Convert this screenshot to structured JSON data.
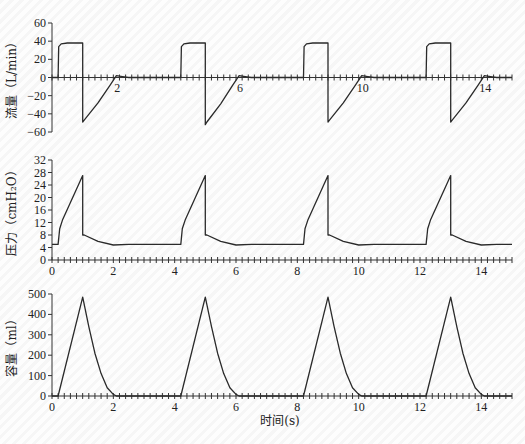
{
  "chart_data": [
    {
      "type": "line",
      "title": "",
      "ylabel": "流量（L/min）",
      "xlabel": "",
      "xlim": [
        0,
        15
      ],
      "ylim": [
        -60,
        60
      ],
      "yticks": [
        60,
        40,
        20,
        0,
        -20,
        -40,
        -60
      ],
      "xticks_labeled": [
        2,
        6,
        10,
        14
      ],
      "x_axis_at_y": 0,
      "grid": false,
      "series": [
        {
          "name": "flow",
          "x": [
            0,
            0.2,
            0.22,
            0.3,
            0.5,
            1.0,
            1.0,
            1.05,
            1.5,
            1.9,
            2.1,
            2.3,
            2.5,
            4.2,
            4.22,
            4.3,
            4.5,
            5.0,
            5.0,
            5.05,
            5.5,
            5.9,
            6.1,
            6.3,
            6.5,
            8.2,
            8.22,
            8.3,
            8.5,
            9.0,
            9.0,
            9.05,
            9.5,
            9.9,
            10.1,
            10.3,
            10.5,
            12.2,
            12.22,
            12.3,
            12.5,
            13.0,
            13.0,
            13.05,
            13.5,
            13.9,
            14.1,
            14.3,
            14.5,
            15.0
          ],
          "values": [
            0,
            0,
            34,
            37,
            38,
            38,
            -49,
            -47,
            -28,
            -8,
            2,
            1,
            0,
            0,
            34,
            37,
            38,
            38,
            -52,
            -49,
            -29,
            -8,
            2,
            1,
            0,
            0,
            34,
            37,
            38,
            38,
            -49,
            -47,
            -28,
            -8,
            2,
            1,
            0,
            0,
            34,
            37,
            38,
            38,
            -49,
            -47,
            -28,
            -8,
            2,
            1,
            0,
            0
          ]
        }
      ]
    },
    {
      "type": "line",
      "title": "",
      "ylabel": "压力（cmH₂O）",
      "xlabel": "",
      "xlim": [
        0,
        15
      ],
      "ylim": [
        0,
        32
      ],
      "yticks": [
        0,
        4,
        8,
        12,
        16,
        20,
        24,
        28,
        32
      ],
      "xticks_labeled": [
        0,
        2,
        4,
        6,
        8,
        10,
        12,
        14
      ],
      "grid": false,
      "series": [
        {
          "name": "pressure",
          "x": [
            0,
            0.2,
            0.25,
            0.35,
            1.0,
            1.0,
            1.05,
            1.5,
            2.0,
            2.5,
            4.2,
            4.25,
            4.35,
            5.0,
            5.0,
            5.05,
            5.5,
            6.0,
            6.5,
            8.2,
            8.25,
            8.35,
            9.0,
            9.0,
            9.05,
            9.5,
            10.0,
            10.5,
            12.2,
            12.25,
            12.35,
            13.0,
            13.0,
            13.05,
            13.5,
            14.0,
            14.5,
            15.0
          ],
          "values": [
            5,
            5,
            10,
            13,
            27,
            8,
            8,
            6,
            4.8,
            5,
            5,
            10,
            13,
            27,
            8,
            8,
            6,
            4.8,
            5,
            5,
            10,
            13,
            27,
            8,
            8,
            6,
            4.8,
            5,
            5,
            10,
            13,
            27,
            8,
            8,
            6,
            4.8,
            5,
            5
          ]
        }
      ]
    },
    {
      "type": "line",
      "title": "",
      "ylabel": "容量（ml）",
      "xlabel": "时间(s)",
      "xlim": [
        0,
        15
      ],
      "ylim": [
        0,
        500
      ],
      "yticks": [
        0,
        100,
        200,
        300,
        400,
        500
      ],
      "xticks_labeled": [
        0,
        2,
        4,
        6,
        8,
        10,
        12,
        14
      ],
      "grid": false,
      "series": [
        {
          "name": "volume",
          "x": [
            0,
            0.2,
            1.0,
            1.2,
            1.4,
            1.6,
            1.8,
            2.0,
            2.1,
            4.2,
            5.0,
            5.2,
            5.4,
            5.6,
            5.8,
            6.0,
            6.1,
            8.2,
            9.0,
            9.2,
            9.4,
            9.6,
            9.8,
            10.0,
            10.1,
            12.2,
            13.0,
            13.2,
            13.4,
            13.6,
            13.8,
            14.0,
            14.1,
            15.0
          ],
          "values": [
            0,
            0,
            485,
            340,
            210,
            110,
            40,
            8,
            0,
            0,
            485,
            340,
            210,
            110,
            40,
            8,
            0,
            0,
            485,
            340,
            210,
            110,
            40,
            8,
            0,
            0,
            485,
            340,
            210,
            110,
            40,
            8,
            0,
            0
          ]
        }
      ]
    }
  ],
  "labels": {
    "flow_ylabel": "流量（L/min）",
    "pressure_ylabel": "压力（cmH₂O）",
    "volume_ylabel": "容量（ml）",
    "xlabel": "时间(s)"
  }
}
